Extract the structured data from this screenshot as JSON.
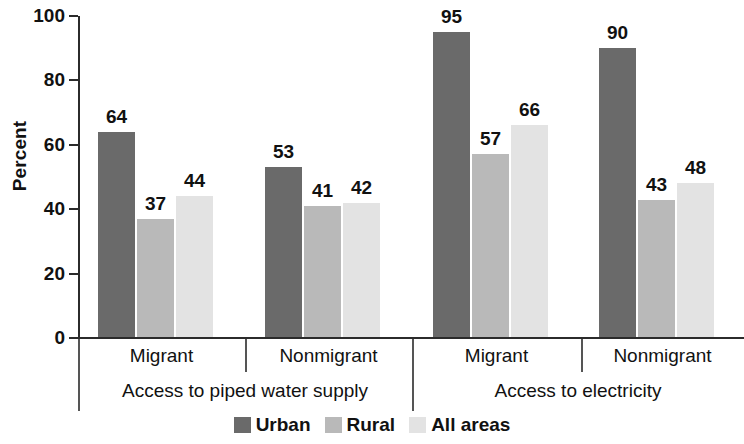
{
  "chart_data": {
    "type": "bar",
    "title": "",
    "xlabel": "",
    "ylabel": "Percent",
    "ylim": [
      0,
      100
    ],
    "yticks": [
      0,
      20,
      40,
      60,
      80,
      100
    ],
    "ytick_labels": [
      "0",
      "20",
      "40",
      "60",
      "80",
      "100"
    ],
    "grid": false,
    "legend_position": "bottom-center",
    "categories": [
      "Migrant",
      "Nonmigrant",
      "Migrant",
      "Nonmigrant"
    ],
    "groups": [
      {
        "label": "Access to piped water supply",
        "categories": [
          {
            "label": "Migrant",
            "bars": [
              {
                "series": "Urban",
                "value": 64,
                "label": "64"
              },
              {
                "series": "Rural",
                "value": 37,
                "label": "37"
              },
              {
                "series": "All areas",
                "value": 44,
                "label": "44"
              }
            ]
          },
          {
            "label": "Nonmigrant",
            "bars": [
              {
                "series": "Urban",
                "value": 53,
                "label": "53"
              },
              {
                "series": "Rural",
                "value": 41,
                "label": "41"
              },
              {
                "series": "All areas",
                "value": 42,
                "label": "42"
              }
            ]
          }
        ]
      },
      {
        "label": "Access to electricity",
        "categories": [
          {
            "label": "Migrant",
            "bars": [
              {
                "series": "Urban",
                "value": 95,
                "label": "95"
              },
              {
                "series": "Rural",
                "value": 57,
                "label": "57"
              },
              {
                "series": "All areas",
                "value": 66,
                "label": "66"
              }
            ]
          },
          {
            "label": "Nonmigrant",
            "bars": [
              {
                "series": "Urban",
                "value": 90,
                "label": "90"
              },
              {
                "series": "Rural",
                "value": 43,
                "label": "43"
              },
              {
                "series": "All areas",
                "value": 48,
                "label": "48"
              }
            ]
          }
        ]
      }
    ],
    "series": [
      {
        "name": "Urban",
        "color": "#6a6a6a",
        "values": [
          64,
          53,
          95,
          90
        ]
      },
      {
        "name": "Rural",
        "color": "#b9b9b9",
        "values": [
          37,
          41,
          57,
          43
        ]
      },
      {
        "name": "All areas",
        "color": "#e3e3e3",
        "values": [
          44,
          42,
          66,
          48
        ]
      }
    ]
  },
  "legend": {
    "items": [
      {
        "label": "Urban",
        "color": "#6a6a6a"
      },
      {
        "label": "Rural",
        "color": "#b9b9b9"
      },
      {
        "label": "All areas",
        "color": "#e3e3e3"
      }
    ]
  },
  "axis": {
    "y_title": "Percent"
  }
}
